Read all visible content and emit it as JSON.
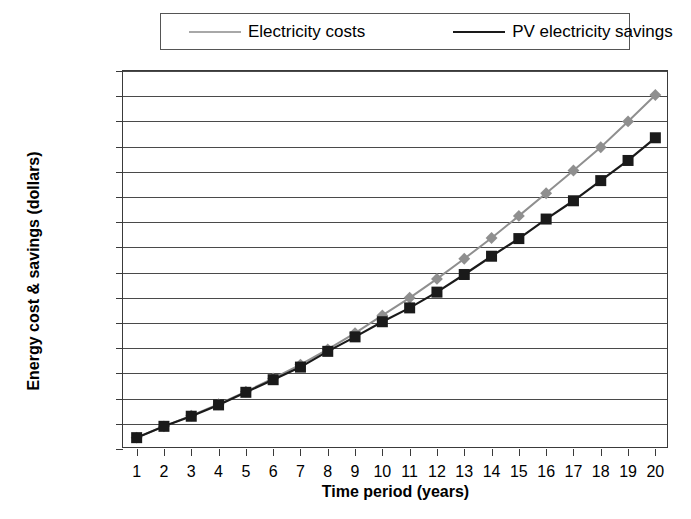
{
  "chart_data": {
    "type": "line",
    "title": "",
    "xlabel": "Time period (years)",
    "ylabel": "Energy cost & savings (dollars)",
    "x": [
      1,
      2,
      3,
      4,
      5,
      6,
      7,
      8,
      9,
      10,
      11,
      12,
      13,
      14,
      15,
      16,
      17,
      18,
      19,
      20
    ],
    "xtick_labels": [
      "1",
      "2",
      "3",
      "4",
      "5",
      "6",
      "7",
      "8",
      "9",
      "10",
      "11",
      "12",
      "13",
      "14",
      "15",
      "16",
      "17",
      "18",
      "19",
      "20"
    ],
    "xlim": [
      0.5,
      20.5
    ],
    "ylim": [
      0,
      30000
    ],
    "ytick_values": [
      0,
      2000,
      4000,
      6000,
      8000,
      10000,
      12000,
      14000,
      16000,
      18000,
      20000,
      22000,
      24000,
      26000,
      28000,
      30000
    ],
    "ytick_labels": [
      "0",
      "2000",
      "4000",
      "6000",
      "8000",
      "10,000",
      "12,000",
      "14,000",
      "16,000",
      "18,000",
      "20,000",
      "22,000",
      "24,000",
      "26,000",
      "28,000",
      "30,000"
    ],
    "grid": true,
    "legend_position": "top",
    "series": [
      {
        "name": "Electricity costs",
        "marker": "diamond",
        "color": "#8f8f8f",
        "values": [
          900,
          1800,
          2650,
          3550,
          4550,
          5600,
          6700,
          7900,
          9200,
          10600,
          12000,
          13500,
          15100,
          16750,
          18500,
          20300,
          22100,
          23950,
          26000,
          28100
        ]
      },
      {
        "name": "PV electricity savings",
        "marker": "square",
        "color": "#1a1a1a",
        "values": [
          900,
          1800,
          2600,
          3500,
          4500,
          5500,
          6500,
          7750,
          8900,
          10100,
          11200,
          12450,
          13850,
          15300,
          16700,
          18250,
          19700,
          21300,
          22900,
          24700
        ]
      }
    ]
  },
  "legend": {
    "items": [
      {
        "label": "Electricity costs",
        "marker": "diamond-marker",
        "color": "#8f8f8f"
      },
      {
        "label": "PV electricity savings",
        "marker": "square-marker",
        "color": "#1a1a1a"
      }
    ]
  },
  "axes": {
    "y_title": "Energy cost & savings (dollars)",
    "x_title": "Time period (years)"
  },
  "colors": {
    "series_1": "#8f8f8f",
    "series_2": "#1a1a1a",
    "grid": "#4a4a4a",
    "axis": "#3a3a3a",
    "background": "#ffffff"
  }
}
